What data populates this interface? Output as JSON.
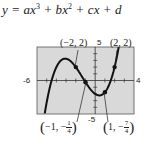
{
  "equation": {
    "prefix": "y = ax",
    "exp1": "3",
    "term2": " + bx",
    "exp2": "2",
    "rest": " + cx + d"
  },
  "window": {
    "xmin_label": "-6",
    "xmax_label": "4",
    "ymax_label": "5",
    "ymin_label": "-5"
  },
  "points": {
    "p1": "(−2, 2)",
    "p2": "(2, 2)",
    "p3_open": "(",
    "p3_x": "−1, −",
    "p3_num": "1",
    "p3_den": "4",
    "p3_close": ")",
    "p4_open": "(",
    "p4_x": "1, −",
    "p4_num": "7",
    "p4_den": "4",
    "p4_close": ")"
  },
  "colors": {
    "plot_bg": "#d9d9d9",
    "curve": "#111111",
    "axis": "#333333"
  },
  "chart_data": {
    "type": "line",
    "function": "y = 0.25x^3 + x^2 - x - 2",
    "xlabel": "",
    "ylabel": "",
    "xlim": [
      -6,
      4
    ],
    "ylim": [
      -5,
      5
    ],
    "grid": false,
    "tick_labels": {
      "x": [
        "-6",
        "4"
      ],
      "y": [
        "5",
        "-5"
      ]
    },
    "series": [
      {
        "name": "cubic",
        "x": [
          -5.5,
          -5,
          -4.5,
          -4,
          -3.5,
          -3,
          -2.5,
          -2,
          -1.5,
          -1,
          -0.5,
          0,
          0.5,
          1,
          1.5,
          2,
          2.5
        ],
        "values": [
          -4.84,
          -1.25,
          1.0,
          2.0,
          2.03,
          1.25,
          0.34,
          2.0,
          -0.09,
          -0.25,
          -1.28,
          -2.0,
          -2.22,
          -1.75,
          -0.41,
          2.0,
          4.66
        ]
      }
    ],
    "highlighted_points": [
      {
        "label": "(-2, 2)",
        "x": -2,
        "y": 2
      },
      {
        "label": "(-1, -1/4)",
        "x": -1,
        "y": -0.25
      },
      {
        "label": "(1, -7/4)",
        "x": 1,
        "y": -1.75
      },
      {
        "label": "(2, 2)",
        "x": 2,
        "y": 2
      }
    ]
  }
}
